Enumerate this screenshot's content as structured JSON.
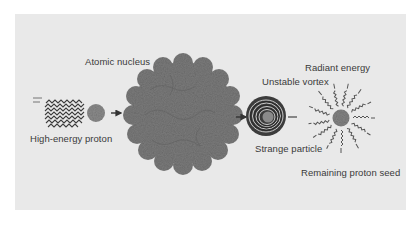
{
  "diagram": {
    "labels": {
      "atomic_nucleus": "Atomic nucleus",
      "high_energy_proton": "High-energy proton",
      "unstable_vortex": "Unstable vortex",
      "strange_particle": "Strange particle",
      "radiant_energy": "Radiant energy",
      "remaining_proton_seed": "Remaining proton seed"
    },
    "stages": [
      {
        "name": "High-energy proton",
        "shape": "small circle with speed-streak tail"
      },
      {
        "name": "Atomic nucleus",
        "shape": "large textured scalloped sphere"
      },
      {
        "name": "Unstable vortex / Strange particle",
        "shape": "concentric swirl circle"
      },
      {
        "name": "Radiant energy / Remaining proton seed",
        "shape": "small circle with wavy radiating rays"
      }
    ],
    "flow": [
      "High-energy proton",
      "Atomic nucleus",
      "Unstable vortex",
      "Radiant energy"
    ],
    "colors": {
      "background": "#ffffff",
      "panel": "#e9e9e9",
      "nucleus": "#7d7d7d",
      "proton": "#8a8a8a",
      "ink": "#3a3a3a"
    }
  }
}
